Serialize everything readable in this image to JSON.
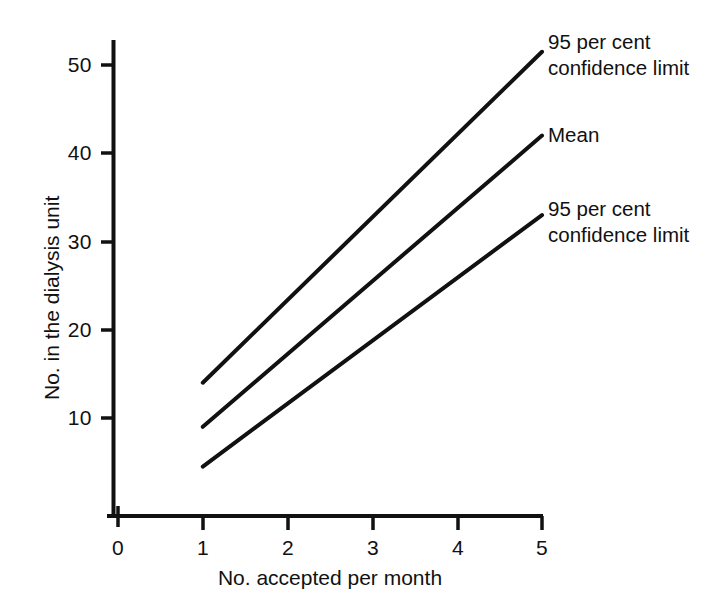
{
  "chart_data": {
    "type": "line",
    "title": "",
    "xlabel": "No. accepted per month",
    "ylabel": "No. in the dialysis unit",
    "xlim": [
      0,
      5
    ],
    "ylim": [
      0,
      53
    ],
    "xticks": [
      "0",
      "1",
      "2",
      "3",
      "4",
      "5"
    ],
    "xtick_values": [
      0,
      1,
      2,
      3,
      4,
      5
    ],
    "yticks": [
      "10",
      "20",
      "30",
      "40",
      "50"
    ],
    "ytick_values": [
      10,
      20,
      30,
      40,
      50
    ],
    "grid": false,
    "legend_position": "inline-right-annotations",
    "x": [
      1,
      5
    ],
    "series": [
      {
        "name": "95 per cent confidence limit",
        "label": "95 per cent\nconfidence limit",
        "position": "upper",
        "values": [
          14,
          51.5
        ],
        "color": "#111111"
      },
      {
        "name": "Mean",
        "label": "Mean",
        "position": "middle",
        "values": [
          9,
          42
        ],
        "color": "#111111"
      },
      {
        "name": "95 per cent confidence limit",
        "label": "95 per cent\nconfidence limit",
        "position": "lower",
        "values": [
          4.5,
          33
        ],
        "color": "#111111"
      }
    ]
  },
  "axes": {
    "x_title": "No. accepted per month",
    "y_title": "No. in the dialysis unit",
    "x_tick_labels": [
      "0",
      "1",
      "2",
      "3",
      "4",
      "5"
    ],
    "y_tick_labels": [
      "50",
      "40",
      "30",
      "20",
      "10"
    ]
  },
  "annotations": {
    "upper_limit_line1": "95 per cent",
    "upper_limit_line2": "confidence limit",
    "mean": "Mean",
    "lower_limit_line1": "95 per cent",
    "lower_limit_line2": "confidence limit"
  },
  "style": {
    "line_color": "#111111",
    "axis_color": "#111111",
    "background": "#ffffff"
  }
}
